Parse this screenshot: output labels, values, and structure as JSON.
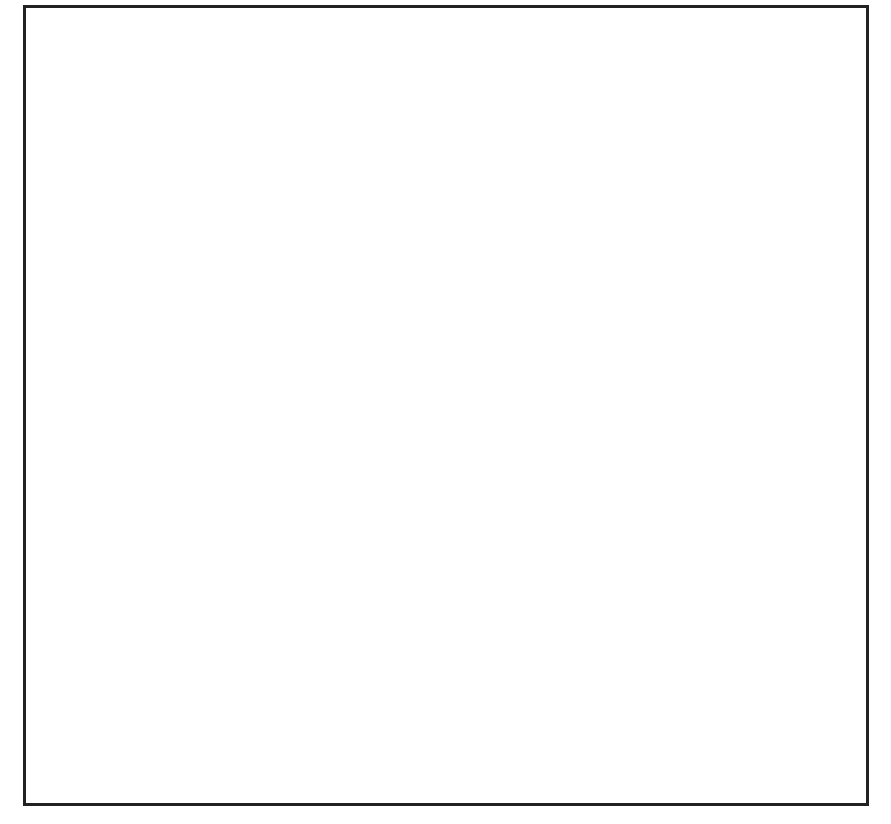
{
  "diagram": {
    "input_label": [
      "I",
      "n",
      "p",
      "u",
      "t"
    ],
    "output_label": [
      "O",
      "u",
      "t",
      "p",
      "u",
      "t"
    ],
    "stage_label": "Stage",
    "stages": [
      "0",
      "1",
      "2"
    ],
    "node_labels": [
      "0",
      "1",
      "2",
      "3",
      "4",
      "5",
      "6",
      "7"
    ],
    "wrap_labels": {
      "stage0": {
        "top": [
          "a",
          "b"
        ],
        "bottom": [
          "b",
          "a"
        ]
      },
      "stage1": {
        "top": [
          "c",
          "e",
          "d",
          "f"
        ],
        "bottom": [
          "e",
          "c",
          "f",
          "d"
        ]
      },
      "stage2": {
        "top": [
          "g",
          "k",
          "h",
          "l",
          "i",
          "m",
          "j",
          "n"
        ],
        "bottom": [
          "k",
          "g",
          "l",
          "h",
          "m",
          "i",
          "n",
          "j"
        ]
      }
    },
    "legend": {
      "solid": "connection to row + 2^stage",
      "dashed": "connection to row - 2^stage",
      "dotted": "straight connection"
    }
  }
}
